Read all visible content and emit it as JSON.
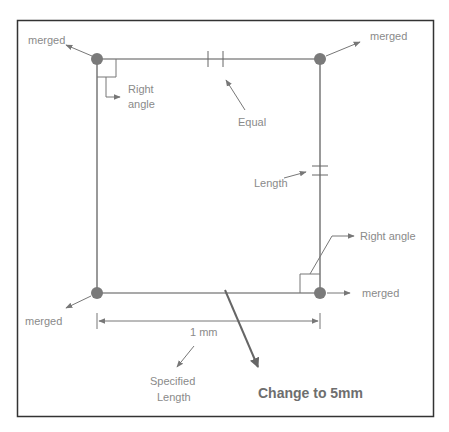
{
  "diagram": {
    "labels": {
      "merged_tl": "merged",
      "merged_tr": "merged",
      "merged_bl": "merged",
      "merged_br": "merged",
      "right_angle_tl_1": "Right",
      "right_angle_tl_2": "angle",
      "equal": "Equal",
      "length": "Length",
      "right_angle_br": "Right angle",
      "dimension": "1 mm",
      "specified_1": "Specified",
      "specified_2": "Length",
      "change": "Change to 5mm"
    },
    "colors": {
      "border": "#333333",
      "line": "#555555",
      "node": "#7a7a7a",
      "label": "#8a8a8a"
    }
  }
}
